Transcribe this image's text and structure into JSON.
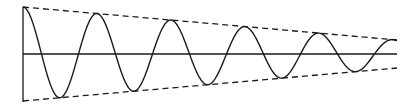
{
  "chart_data": {
    "type": "line",
    "title": "",
    "xlabel": "",
    "ylabel": "",
    "grid": false,
    "series": [
      {
        "name": "damped-wave",
        "style": "solid",
        "color": "#1a1a1a",
        "function": "A0*exp(-k*t)*cos(2*pi*t/T)",
        "A0": 47,
        "T_px": 74,
        "periods": 5.0
      },
      {
        "name": "upper-envelope",
        "style": "dashed",
        "color": "#1a1a1a"
      },
      {
        "name": "lower-envelope",
        "style": "dashed",
        "color": "#1a1a1a"
      }
    ],
    "geometry": {
      "x0": 23,
      "x1": 397,
      "y_axis_top": 7,
      "y_axis_bottom": 102,
      "baseline_y": 54,
      "amp_start": 47,
      "amp_end": 14
    }
  },
  "colors": {
    "ink": "#1a1a1a",
    "background": "#ffffff"
  }
}
